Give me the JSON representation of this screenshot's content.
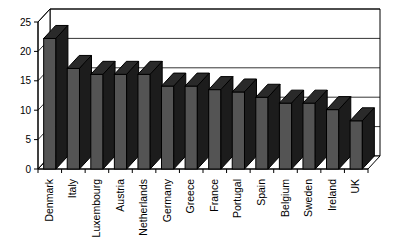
{
  "chart_data": {
    "type": "bar",
    "title": "",
    "subtitle": "",
    "xlabel": "",
    "ylabel": "",
    "ylim": [
      0,
      25
    ],
    "yticks": [
      0,
      5,
      10,
      15,
      20,
      25
    ],
    "ytick_labels": [
      "0",
      "5",
      "10",
      "15",
      "20",
      "25"
    ],
    "grid": true,
    "legend": false,
    "legend_position": "none",
    "style": "3d-perspective-column",
    "bar_color": "#545454",
    "bar_top_color": "#2a2a2a",
    "bar_side_color": "#1c1c1c",
    "axis_color": "#000000",
    "background_color": "#ffffff",
    "category_label_rotation": -90,
    "categories": [
      "Denmark",
      "Italy",
      "Luxembourg",
      "Austria",
      "Netherlands",
      "Germany",
      "Greece",
      "France",
      "Portugal",
      "Spain",
      "Belgium",
      "Sweden",
      "Ireland",
      "UK"
    ],
    "values": [
      22.2,
      17.1,
      16.1,
      16.1,
      16.1,
      14.1,
      14.1,
      13.5,
      13.1,
      12.2,
      11.2,
      11.2,
      10.1,
      8.2
    ],
    "series": [
      {
        "name": "",
        "values": [
          22.2,
          17.1,
          16.1,
          16.1,
          16.1,
          14.1,
          14.1,
          13.5,
          13.1,
          12.2,
          11.2,
          11.2,
          10.1,
          8.2
        ]
      }
    ]
  }
}
